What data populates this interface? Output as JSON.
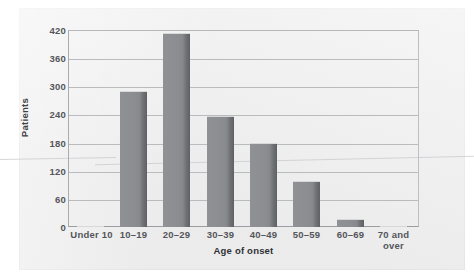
{
  "chart_data": {
    "type": "bar",
    "title": "",
    "xlabel": "Age of onset",
    "ylabel": "Patients",
    "categories": [
      "Under 10",
      "10–19",
      "20–29",
      "30–39",
      "40–49",
      "50–59",
      "60–69",
      "70 and over"
    ],
    "values": [
      3,
      290,
      414,
      237,
      180,
      98,
      18,
      3
    ],
    "ylim": [
      0,
      420
    ],
    "yticks": [
      0,
      60,
      120,
      180,
      240,
      300,
      360,
      420
    ],
    "ytick_labels": [
      "0",
      "60",
      "120",
      "180",
      "240",
      "300",
      "360",
      "420"
    ],
    "grid": true,
    "grid_axis": "y",
    "legend": false,
    "legend_position": "none",
    "bar_color": "#8b8d91",
    "bar_edge_color": "#5e6064",
    "gridline_color": "#b9bbbe",
    "background_color": "#ececed"
  },
  "figure": {
    "y_axis_label": "Patients",
    "x_axis_label": "Age of onset",
    "x_tick_lines": [
      [
        "Under 10"
      ],
      [
        "10–19"
      ],
      [
        "20–29"
      ],
      [
        "30–39"
      ],
      [
        "40–49"
      ],
      [
        "50–59"
      ],
      [
        "60–69"
      ],
      [
        "70 and",
        "over"
      ]
    ]
  }
}
